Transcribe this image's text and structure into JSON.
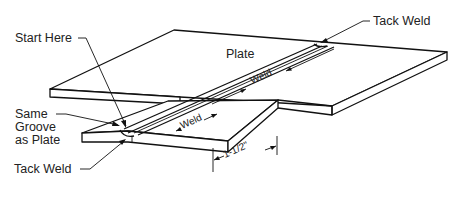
{
  "figure": {
    "type": "isometric weld joint diagram",
    "labels": {
      "plate": "Plate",
      "start_here": "Start Here",
      "tack_weld_top": "Tack Weld",
      "tack_weld_bottom": "Tack Weld",
      "same_groove_line1": "Same",
      "same_groove_line2": "Groove",
      "same_groove_line3": "as Plate",
      "weld_upper": "Weld",
      "weld_lower": "Weld",
      "dimension": "1-1/2\""
    },
    "colors": {
      "line": "#111111",
      "text": "#222222",
      "background": "#ffffff"
    }
  }
}
